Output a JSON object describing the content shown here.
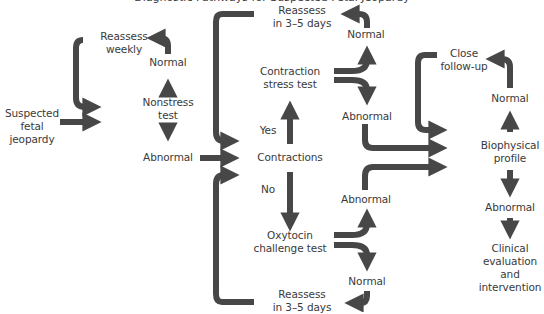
{
  "title": "Diagnostic Pathways for Suspected Fetal Jeopardy",
  "colors": {
    "arrow": "#474747",
    "text": "#3a3a3a",
    "background": "#ffffff"
  },
  "nodes": {
    "start": "Suspected fetal jeopardy",
    "start_l1": "Suspected",
    "start_l2": "fetal",
    "start_l3": "jeopardy",
    "nst_reassess_l1": "Reassess",
    "nst_reassess_l2": "weekly",
    "nst_normal": "Normal",
    "nst_l1": "Nonstress",
    "nst_l2": "test",
    "nst_abnormal": "Abnormal",
    "contractions": "Contractions",
    "yes": "Yes",
    "no": "No",
    "cst_reassess_l1": "Reassess",
    "cst_reassess_l2": "in 3–5 days",
    "cst_normal": "Normal",
    "cst_l1": "Contraction",
    "cst_l2": "stress test",
    "cst_abnormal": "Abnormal",
    "oct_abnormal": "Abnormal",
    "oct_l1": "Oxytocin",
    "oct_l2": "challenge test",
    "oct_normal": "Normal",
    "oct_reassess_l1": "Reassess",
    "oct_reassess_l2": "in 3–5 days",
    "close_l1": "Close",
    "close_l2": "follow-up",
    "bpp_normal": "Normal",
    "bpp_l1": "Biophysical",
    "bpp_l2": "profile",
    "bpp_abnormal": "Abnormal",
    "clin_l1": "Clinical",
    "clin_l2": "evaluation",
    "clin_l3": "and",
    "clin_l4": "intervention"
  }
}
